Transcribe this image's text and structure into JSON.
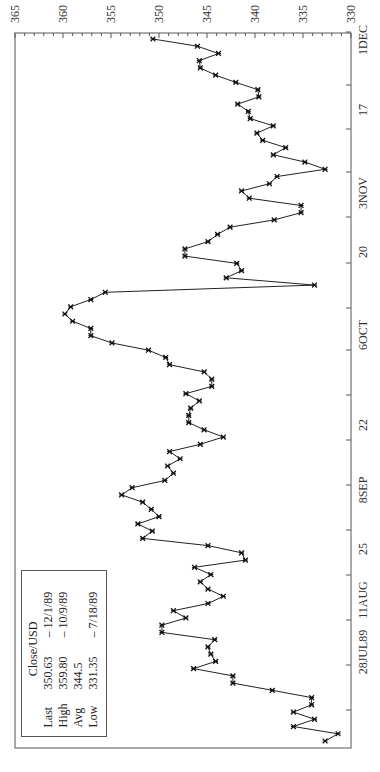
{
  "chart_data": {
    "type": "line",
    "orientation": "rotated-90-ccw",
    "title": "Close/USD",
    "xlabel": "",
    "ylabel": "",
    "ylim": [
      330,
      365
    ],
    "y_ticks": [
      365,
      360,
      355,
      350,
      345,
      340,
      335,
      330
    ],
    "x_tick_labels": [
      "28JUL89",
      "11AUG",
      "25",
      "8SEP",
      "22",
      "6OCT",
      "20",
      "3NOV",
      "17",
      "1DEC"
    ],
    "x_range": [
      "7/17/89",
      "12/1/89"
    ],
    "marker": "asterisk",
    "series": [
      {
        "name": "Close/USD",
        "values": [
          332.7,
          331.35,
          336.0,
          333.8,
          336.0,
          334.1,
          334.1,
          338.2,
          342.3,
          342.3,
          346.4,
          344.1,
          344.6,
          344.9,
          344.2,
          349.7,
          349.7,
          347.2,
          348.5,
          344.9,
          343.3,
          344.9,
          345.7,
          344.6,
          346.3,
          341.0,
          341.4,
          344.9,
          351.7,
          350.7,
          352.2,
          350.0,
          350.8,
          351.7,
          353.9,
          352.8,
          349.4,
          348.5,
          349.1,
          347.8,
          348.9,
          345.7,
          343.3,
          345.3,
          346.9,
          346.9,
          346.7,
          345.8,
          347.2,
          344.5,
          344.5,
          345.3,
          348.9,
          349.3,
          351.1,
          354.9,
          357.1,
          357.1,
          359.0,
          359.8,
          359.2,
          357.1,
          355.6,
          333.8,
          343.0,
          341.4,
          341.9,
          347.3,
          347.3,
          344.9,
          343.9,
          342.6,
          338.0,
          335.2,
          335.2,
          340.6,
          341.4,
          338.5,
          337.7,
          332.7,
          334.8,
          338.1,
          336.8,
          339.2,
          339.8,
          338.1,
          340.5,
          340.7,
          341.8,
          339.6,
          339.7,
          342.0,
          344.1,
          345.7,
          345.8,
          343.8,
          346.0,
          350.63
        ]
      }
    ],
    "legend": {
      "title": "Close/USD",
      "rows": [
        {
          "label": "Last",
          "value": "350.63",
          "date": "– 12/1/89"
        },
        {
          "label": "High",
          "value": "359.80",
          "date": "– 10/9/89"
        },
        {
          "label": "Avg",
          "value": "344.5",
          "date": ""
        },
        {
          "label": "Low",
          "value": "331.35",
          "date": "– 7/18/89"
        }
      ]
    },
    "colors": {
      "line": "#222222",
      "axis": "#555555",
      "background": "#ffffff"
    }
  }
}
